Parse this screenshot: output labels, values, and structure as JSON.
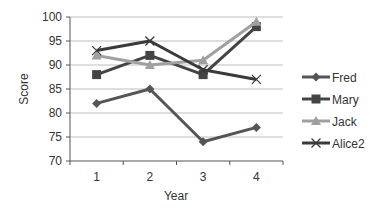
{
  "chart_data": {
    "type": "line",
    "title": "",
    "xlabel": "Year",
    "ylabel": "Score",
    "x": [
      1,
      2,
      3,
      4
    ],
    "categories": [
      "1",
      "2",
      "3",
      "4"
    ],
    "ylim": [
      70,
      100
    ],
    "yticks": [
      70,
      75,
      80,
      85,
      90,
      95,
      100
    ],
    "grid": true,
    "legend_position": "right",
    "series": [
      {
        "name": "Fred",
        "values": [
          82,
          85,
          74,
          77
        ],
        "color": "#555555",
        "marker": "diamond"
      },
      {
        "name": "Mary",
        "values": [
          88,
          92,
          88,
          98
        ],
        "color": "#444444",
        "marker": "square"
      },
      {
        "name": "Jack",
        "values": [
          92,
          90,
          91,
          99
        ],
        "color": "#a0a0a0",
        "marker": "triangle"
      },
      {
        "name": "Alice2",
        "values": [
          93,
          95,
          89,
          87
        ],
        "color": "#3a3a3a",
        "marker": "x"
      }
    ]
  }
}
